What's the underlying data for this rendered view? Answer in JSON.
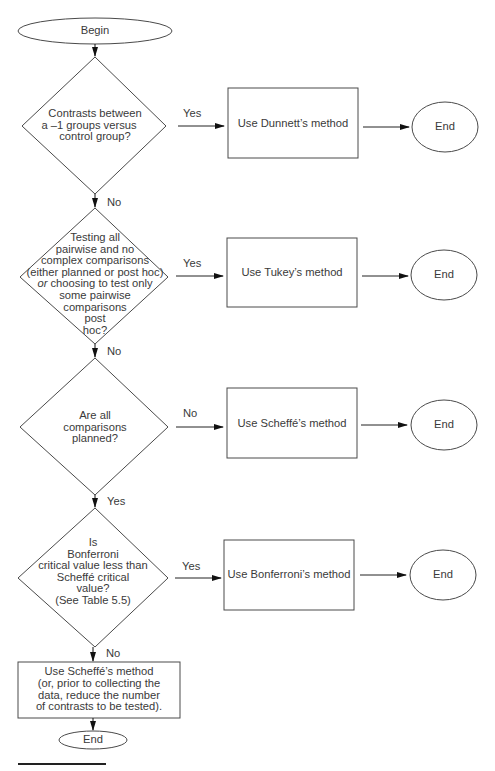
{
  "flowchart": {
    "start": {
      "label": "Begin"
    },
    "decisions": [
      {
        "id": "d1",
        "lines": [
          "Contrasts between",
          "a –1 groups versus",
          "control group?"
        ],
        "yes_label": "Yes",
        "no_label": "No",
        "side_branch": "Yes",
        "down_branch": "No"
      },
      {
        "id": "d2",
        "lines": [
          "Testing all",
          "pairwise and no",
          "complex comparisons",
          "(either planned or post hoc)",
          "or choosing to test only",
          "some pairwise",
          "comparisons",
          "post",
          "hoc?"
        ],
        "side_label": "Yes",
        "down_label": "No"
      },
      {
        "id": "d3",
        "lines": [
          "Are all",
          "comparisons",
          "planned?"
        ],
        "side_label": "No",
        "down_label": "Yes"
      },
      {
        "id": "d4",
        "lines": [
          "Is",
          "Bonferroni",
          "critical value less than",
          "Scheffé critical",
          "value?",
          "(See Table 5.5)"
        ],
        "side_label": "Yes",
        "down_label": "No"
      }
    ],
    "actions": [
      {
        "label": "Use Dunnett’s method"
      },
      {
        "label": "Use Tukey’s method"
      },
      {
        "label": "Use Scheffé’s method"
      },
      {
        "label": "Use Bonferroni’s method"
      }
    ],
    "ends": [
      {
        "label": "End"
      },
      {
        "label": "End"
      },
      {
        "label": "End"
      },
      {
        "label": "End"
      }
    ],
    "final_action": {
      "lines": [
        "Use Scheffé’s method",
        "(or, prior to collecting the",
        "data, reduce the number",
        "of contrasts to be tested)."
      ]
    },
    "final_end": {
      "label": "End"
    },
    "d1_labels": {
      "side": "Yes",
      "down": "No"
    },
    "d2_or_word": "or",
    "d2_rest": " choosing to test only"
  },
  "colors": {
    "stroke": "#4a4a4a",
    "text": "#3a3a3a",
    "background": "#ffffff"
  }
}
